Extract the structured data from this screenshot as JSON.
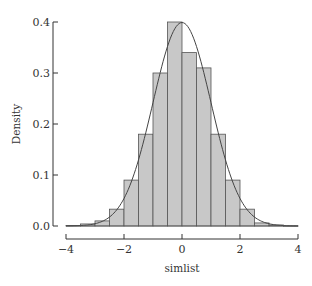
{
  "chart_data": {
    "type": "bar",
    "subtype": "histogram_with_density_curve",
    "title": "",
    "xlabel": "simlist",
    "ylabel": "Density",
    "xlim": [
      -4,
      4
    ],
    "ylim": [
      0,
      0.4
    ],
    "x_ticks": [
      -4,
      -2,
      0,
      2,
      4
    ],
    "x_tick_labels": [
      "−4",
      "−2",
      "0",
      "2",
      "4"
    ],
    "y_ticks": [
      0.0,
      0.1,
      0.2,
      0.3,
      0.4
    ],
    "y_tick_labels": [
      "0.0",
      "0.1",
      "0.2",
      "0.3",
      "0.4"
    ],
    "bin_width": 0.5,
    "bins": [
      {
        "x0": -4.0,
        "x1": -3.5,
        "density": 0.001
      },
      {
        "x0": -3.5,
        "x1": -3.0,
        "density": 0.004
      },
      {
        "x0": -3.0,
        "x1": -2.5,
        "density": 0.01
      },
      {
        "x0": -2.5,
        "x1": -2.0,
        "density": 0.033
      },
      {
        "x0": -2.0,
        "x1": -1.5,
        "density": 0.09
      },
      {
        "x0": -1.5,
        "x1": -1.0,
        "density": 0.18
      },
      {
        "x0": -1.0,
        "x1": -0.5,
        "density": 0.3
      },
      {
        "x0": -0.5,
        "x1": 0.0,
        "density": 0.4
      },
      {
        "x0": 0.0,
        "x1": 0.5,
        "density": 0.34
      },
      {
        "x0": 0.5,
        "x1": 1.0,
        "density": 0.31
      },
      {
        "x0": 1.0,
        "x1": 1.5,
        "density": 0.18
      },
      {
        "x0": 1.5,
        "x1": 2.0,
        "density": 0.09
      },
      {
        "x0": 2.0,
        "x1": 2.5,
        "density": 0.033
      },
      {
        "x0": 2.5,
        "x1": 3.0,
        "density": 0.006
      },
      {
        "x0": 3.0,
        "x1": 3.5,
        "density": 0.002
      },
      {
        "x0": 3.5,
        "x1": 4.0,
        "density": 0.0005
      }
    ],
    "curve": {
      "name": "Standard normal density",
      "mean": 0,
      "sd": 1
    },
    "grid": false,
    "legend": null,
    "colors": {
      "bar_fill": "#c8c8c8",
      "bar_stroke": "#555555",
      "curve": "#444444",
      "axis": "#333333"
    }
  }
}
